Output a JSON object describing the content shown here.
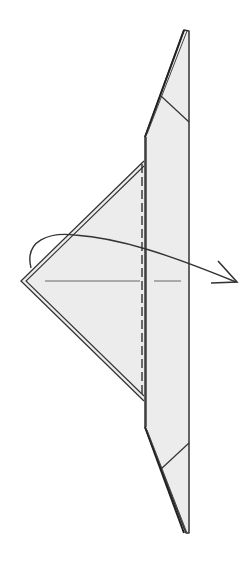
{
  "diagram": {
    "type": "origami-step",
    "colors": {
      "background": "#ffffff",
      "paper_fill": "#ececec",
      "line": "#333333",
      "arrow": "#333333"
    },
    "elements": [
      {
        "name": "paper-strip",
        "kind": "polygon"
      },
      {
        "name": "top-crease",
        "kind": "line"
      },
      {
        "name": "bottom-crease",
        "kind": "line"
      },
      {
        "name": "triangle-flap",
        "kind": "polygon-double-edge"
      },
      {
        "name": "valley-fold-line",
        "kind": "dashed-line"
      },
      {
        "name": "center-reference-line",
        "kind": "line"
      },
      {
        "name": "fold-over-arrow",
        "kind": "curved-arrow"
      }
    ]
  }
}
